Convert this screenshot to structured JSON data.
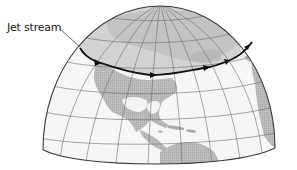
{
  "figure": {
    "label": "Jet stream",
    "colors": {
      "ocean": "#f7f7f7",
      "polar_shade": "#c9c9c9",
      "land": "#b9b9b9",
      "land_polar": "#a8a8a8",
      "grid": "#7a7a7a",
      "outline": "#444444",
      "jet_stream": "#111111"
    },
    "jet_stream_arrows": 5
  }
}
